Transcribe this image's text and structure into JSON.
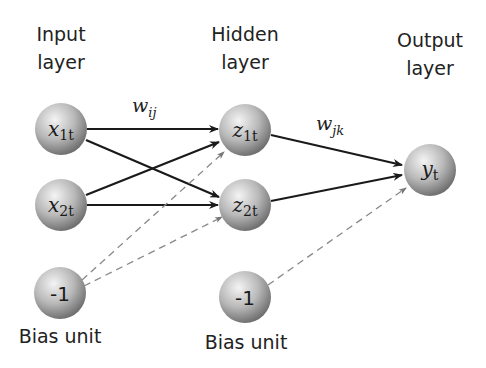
{
  "layers": {
    "input": {
      "title_line1": "Input",
      "title_line2": "layer"
    },
    "hidden": {
      "title_line1": "Hidden",
      "title_line2": "layer"
    },
    "output": {
      "title_line1": "Output",
      "title_line2": "layer"
    }
  },
  "nodes": {
    "x1": {
      "base": "x",
      "sub": "1t"
    },
    "x2": {
      "base": "x",
      "sub": "2t"
    },
    "z1": {
      "base": "z",
      "sub": "1t"
    },
    "z2": {
      "base": "z",
      "sub": "2t"
    },
    "y": {
      "base": "y",
      "sub": "t"
    },
    "bias_input": {
      "value": "-1"
    },
    "bias_hidden": {
      "value": "-1"
    }
  },
  "weights": {
    "input_hidden": {
      "base": "w",
      "sub": "ij"
    },
    "hidden_output": {
      "base": "w",
      "sub": "jk"
    }
  },
  "bias_labels": {
    "input": "Bias unit",
    "hidden": "Bias unit"
  },
  "colors": {
    "edge": "#1a1a1a",
    "bias_edge": "#888888",
    "node_light": "#f2f2f2",
    "node_dark": "#7a7a7a"
  }
}
